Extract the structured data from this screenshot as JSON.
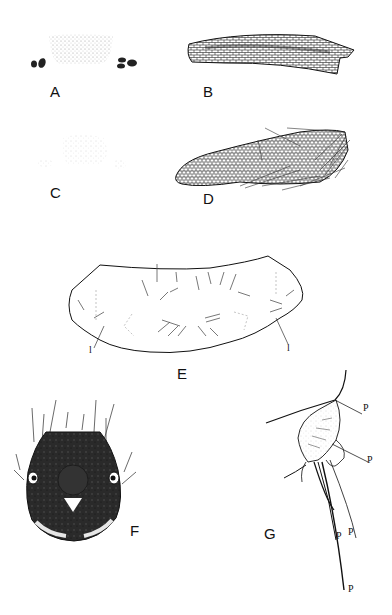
{
  "figure": {
    "panels": [
      {
        "id": "A",
        "label": "A",
        "description": "stippled median plate with paired dark lateral sclerites"
      },
      {
        "id": "B",
        "label": "B",
        "description": "elongate curved reticulate sclerite, densely pigmented"
      },
      {
        "id": "C",
        "label": "C",
        "description": "faint stippled median plate with small lateral patches"
      },
      {
        "id": "D",
        "label": "D",
        "description": "elongate reticulate structure with setae at apex"
      },
      {
        "id": "E",
        "label": "E",
        "description": "outline of plate with scattered setae; lateral markers"
      },
      {
        "id": "F",
        "label": "F",
        "description": "dark head capsule, dorsal view, with setae"
      },
      {
        "id": "G",
        "label": "G",
        "description": "lateral view of appendage with labeled setae"
      }
    ],
    "panel_E_markers": [
      "l",
      "l"
    ],
    "panel_G_markers": [
      "P",
      "P",
      "P",
      "P",
      "P"
    ],
    "colors": {
      "ink": "#111111",
      "background": "#ffffff",
      "stipple": "#8a8a8a"
    }
  }
}
